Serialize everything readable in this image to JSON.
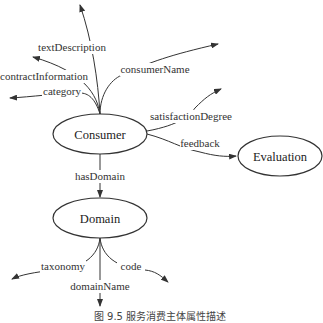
{
  "nodes": {
    "consumer": "Consumer",
    "evaluation": "Evaluation",
    "domain": "Domain"
  },
  "edges": {
    "textDescription": "textDescription",
    "contractInformation": "contractInformation",
    "category": "category",
    "consumerName": "consumerName",
    "satisfactionDegree": "satisfactionDegree",
    "feedback": "feedback",
    "hasDomain": "hasDomain",
    "taxonomy": "taxonomy",
    "domainName": "domainName",
    "code": "code"
  },
  "caption": "图 9.5  服务消费主体属性描述"
}
